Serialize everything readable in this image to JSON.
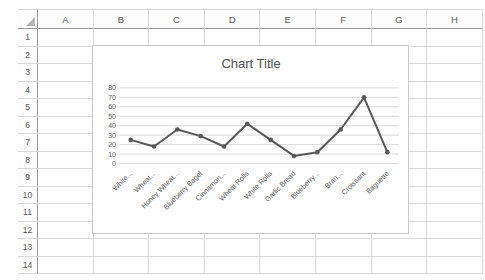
{
  "spreadsheet": {
    "column_headers": [
      "A",
      "B",
      "C",
      "D",
      "E",
      "F",
      "G",
      "H"
    ],
    "row_headers": [
      "1",
      "2",
      "3",
      "4",
      "5",
      "6",
      "7",
      "8",
      "9",
      "10",
      "11",
      "12",
      "13",
      "14"
    ]
  },
  "chart_data": {
    "type": "line",
    "title": "Chart Title",
    "categories": [
      "White...",
      "Wheat...",
      "Honey Wheat...",
      "Blueberry Bagel",
      "Cinnamon...",
      "Wheat Rolls",
      "White Rolls",
      "Garlic Bread",
      "Blueberry...",
      "Bran...",
      "Croissant",
      "Baguette"
    ],
    "values": [
      25,
      18,
      36,
      29,
      18,
      42,
      25,
      8,
      12,
      36,
      70,
      12
    ],
    "xlabel": "",
    "ylabel": "",
    "ylim": [
      0,
      80
    ],
    "ytick_interval": 10,
    "ytick_labels": [
      "0",
      "10",
      "20",
      "30",
      "40",
      "50",
      "60",
      "70",
      "80"
    ],
    "grid": true,
    "legend": false,
    "marker": "circle",
    "x_label_rotation_deg": 45
  },
  "colors": {
    "series": "#595959",
    "marker": "#595959",
    "chart_gridline": "#d9d9d9",
    "axis_text": "#595959",
    "title_text": "#535353",
    "sheet_header_text": "#595959",
    "sheet_gridline": "#d9d9d9",
    "sheet_header_divider": "#9b9b9b",
    "chart_border": "#c9c9c9",
    "background": "#ffffff"
  }
}
